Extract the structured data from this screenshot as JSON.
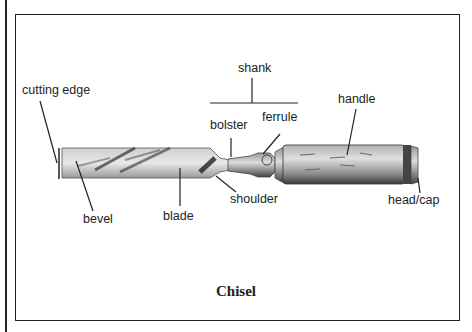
{
  "diagram": {
    "title": "Chisel",
    "labels": {
      "cutting_edge": "cutting edge",
      "shank": "shank",
      "handle": "handle",
      "bolster": "bolster",
      "ferrule": "ferrule",
      "bevel": "bevel",
      "blade": "blade",
      "shoulder": "shoulder",
      "head_cap": "head/cap"
    }
  }
}
